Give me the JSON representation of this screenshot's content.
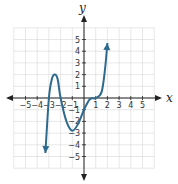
{
  "chart_data": {
    "type": "line",
    "title": "",
    "xlabel": "x",
    "ylabel": "y",
    "xlim": [
      -6,
      6
    ],
    "ylim": [
      -6,
      6
    ],
    "grid": true,
    "x_ticks": [
      "-5",
      "-4",
      "-3",
      "-2",
      "-1",
      "1",
      "2",
      "3",
      "4",
      "5"
    ],
    "y_ticks": [
      "5",
      "4",
      "3",
      "2",
      "1",
      "-1",
      "-2",
      "-3",
      "-4",
      "-5"
    ],
    "series": [
      {
        "name": "polynomial",
        "color": "#2e6a8e",
        "x": [
          -3.3,
          -3.0,
          -2.75,
          -2.5,
          -2.25,
          -2.0,
          -1.5,
          -1.0,
          -0.5,
          0.0,
          0.5,
          1.0,
          1.5,
          1.8,
          2.0
        ],
        "y": [
          -4.7,
          0.0,
          1.6,
          2.0,
          1.6,
          0.0,
          -2.0,
          -2.8,
          -2.2,
          -1.0,
          -0.1,
          0.0,
          0.5,
          2.5,
          4.7
        ],
        "end_arrows": true
      }
    ]
  },
  "labels": {
    "x_axis": "x",
    "y_axis": "y"
  }
}
